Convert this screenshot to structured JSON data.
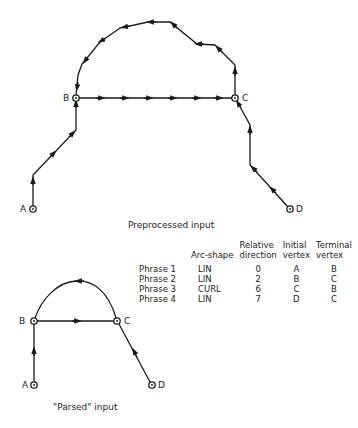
{
  "preprocessed": {
    "caption": "Preprocessed input",
    "vertices": [
      {
        "id": "A",
        "label": "A",
        "x": 33,
        "y": 209
      },
      {
        "id": "B",
        "label": "B",
        "x": 76,
        "y": 98
      },
      {
        "id": "C",
        "label": "C",
        "x": 235,
        "y": 98
      },
      {
        "id": "D",
        "label": "D",
        "x": 290,
        "y": 209
      }
    ],
    "paths": [
      {
        "name": "A-to-B",
        "points": [
          [
            33,
            209
          ],
          [
            33,
            175
          ],
          [
            76,
            130
          ],
          [
            76,
            98
          ]
        ]
      },
      {
        "name": "B-to-C",
        "points": [
          [
            76,
            98
          ],
          [
            235,
            98
          ]
        ]
      },
      {
        "name": "C-to-B-curl",
        "points": [
          [
            235,
            98
          ],
          [
            235,
            65
          ],
          [
            215,
            45
          ],
          [
            197,
            44
          ],
          [
            170,
            22
          ],
          [
            148,
            22
          ],
          [
            120,
            28
          ],
          [
            100,
            42
          ],
          [
            82,
            64
          ],
          [
            78,
            75
          ],
          [
            76,
            98
          ]
        ]
      },
      {
        "name": "D-to-C",
        "points": [
          [
            290,
            209
          ],
          [
            250,
            165
          ],
          [
            250,
            125
          ],
          [
            235,
            98
          ]
        ]
      }
    ]
  },
  "parsed": {
    "caption": "\"Parsed\" input",
    "vertices": [
      {
        "id": "A",
        "label": "A",
        "x": 34,
        "y": 385
      },
      {
        "id": "B",
        "label": "B",
        "x": 34,
        "y": 321
      },
      {
        "id": "C",
        "label": "C",
        "x": 117,
        "y": 321
      },
      {
        "id": "D",
        "label": "D",
        "x": 152,
        "y": 385
      }
    ]
  },
  "table": {
    "headers": [
      "",
      "Arc-shape",
      "Relative direction",
      "Initial vertex",
      "Terminal vertex"
    ],
    "header_lines": [
      [
        "",
        ""
      ],
      [
        "",
        "Arc-shape"
      ],
      [
        "Relative",
        "direction"
      ],
      [
        "Initial",
        "vertex"
      ],
      [
        "Terminal",
        "vertex"
      ]
    ],
    "rows": [
      {
        "phrase": "Phrase  1",
        "arc_shape": "LIN",
        "relative_direction": "0",
        "initial_vertex": "A",
        "terminal_vertex": "B"
      },
      {
        "phrase": "Phrase  2",
        "arc_shape": "LIN",
        "relative_direction": "2",
        "initial_vertex": "B",
        "terminal_vertex": "C"
      },
      {
        "phrase": "Phrase  3",
        "arc_shape": "CURL",
        "relative_direction": "6",
        "initial_vertex": "C",
        "terminal_vertex": "B"
      },
      {
        "phrase": "Phrase  4",
        "arc_shape": "LIN",
        "relative_direction": "7",
        "initial_vertex": "D",
        "terminal_vertex": "C"
      }
    ]
  },
  "colors": {
    "ink": "#1a1a1a",
    "background": "#ffffff"
  }
}
